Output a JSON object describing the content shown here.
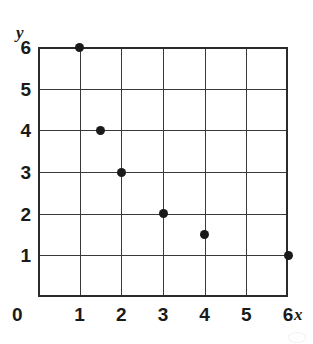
{
  "chart_data": {
    "type": "scatter",
    "title": "",
    "xlabel": "x",
    "ylabel": "y",
    "xlim": [
      0,
      6
    ],
    "ylim": [
      0,
      6
    ],
    "grid": true,
    "legend": "none",
    "x_ticks": [
      "1",
      "2",
      "3",
      "4",
      "5",
      "6"
    ],
    "x_tick_values": [
      1,
      2,
      3,
      4,
      5,
      6
    ],
    "y_ticks": [
      "1",
      "2",
      "3",
      "4",
      "5",
      "6"
    ],
    "y_tick_values": [
      1,
      2,
      3,
      4,
      5,
      6
    ],
    "origin_label": "0",
    "points": [
      {
        "x": 1,
        "y": 6
      },
      {
        "x": 1.5,
        "y": 4
      },
      {
        "x": 2,
        "y": 3
      },
      {
        "x": 3,
        "y": 2
      },
      {
        "x": 4,
        "y": 1.5
      },
      {
        "x": 6,
        "y": 1
      }
    ],
    "point_color": "#1a1a1a",
    "grid_color": "#3a3a3a",
    "frame_color": "#2b2b2b",
    "background": "#ffffff"
  }
}
